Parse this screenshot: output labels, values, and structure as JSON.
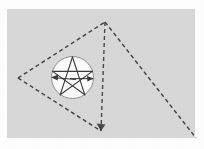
{
  "figure": {
    "width": 204,
    "height": 149,
    "page_background": "#ffffff",
    "paper_background": "#d9d9d9",
    "ink_color": "#3a3a3a",
    "circle_fill": "#fdfdfd",
    "circle_stroke": "#8c8c8c"
  },
  "paper": {
    "name": "scanned-paper-sheet",
    "x": 7,
    "y": 9,
    "width": 188,
    "height": 129,
    "fill": "#d9d9d9"
  },
  "polygon": {
    "name": "dashed-polygon",
    "stroke": "#3f3f3f",
    "stroke_width": 1.4,
    "dash_pattern": "4 3",
    "vertices": [
      {
        "label": "left-vertex",
        "x": 18,
        "y": 78
      },
      {
        "label": "top-vertex",
        "x": 105,
        "y": 22
      },
      {
        "label": "right-offpage-vertex",
        "x": 196,
        "y": 138
      },
      {
        "label": "bottom-vertex",
        "x": 101,
        "y": 131
      }
    ],
    "vertex_count": 4
  },
  "circle": {
    "name": "inscribed-circle",
    "cx": 72.5,
    "cy": 77.5,
    "r": 21.0,
    "fill": "#fdfdfd",
    "stroke": "#8f8f8f",
    "stroke_width": 1.0
  },
  "pentagram": {
    "name": "pentagram-star",
    "stroke": "#3a3a3a",
    "stroke_width": 1.1,
    "points": [
      {
        "label": "apex",
        "x": 72.5,
        "y": 57.0
      },
      {
        "label": "right",
        "x": 92.4,
        "y": 71.4
      },
      {
        "label": "lower-right",
        "x": 84.8,
        "y": 94.8
      },
      {
        "label": "lower-left",
        "x": 60.2,
        "y": 94.8
      },
      {
        "label": "left",
        "x": 52.6,
        "y": 71.4
      }
    ],
    "edges": [
      {
        "from": 0,
        "to": 2
      },
      {
        "from": 2,
        "to": 4
      },
      {
        "from": 4,
        "to": 1
      },
      {
        "from": 1,
        "to": 3
      },
      {
        "from": 3,
        "to": 0
      }
    ]
  },
  "arrows": [
    {
      "name": "arrow-left-radius",
      "tip_x": 52.0,
      "tip_y": 77.5,
      "direction": "left",
      "angle_deg": 180,
      "size": 5.5
    },
    {
      "name": "arrow-right-radius",
      "tip_x": 93.0,
      "tip_y": 78.5,
      "direction": "right",
      "angle_deg": 8,
      "size": 5.5
    }
  ],
  "annotations": {
    "caption": "",
    "labels": []
  }
}
